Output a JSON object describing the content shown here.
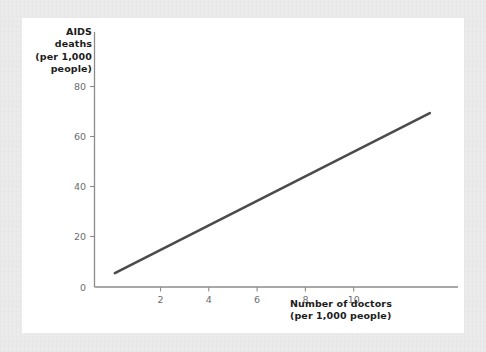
{
  "figure": {
    "card_background": "#ffffff",
    "mat_background": "#ebebec"
  },
  "chart_data": {
    "type": "line",
    "title": "",
    "subtitle": "",
    "ylabel_lines": [
      "AIDS",
      "deaths",
      "(per 1,000",
      "people)"
    ],
    "ylabel": "AIDS deaths (per 1,000 people)",
    "xlabel_lines": [
      "Number of doctors",
      "(per 1,000 people)"
    ],
    "xlabel": "Number of doctors (per 1,000 people)",
    "xlim": [
      0,
      11.6
    ],
    "ylim": [
      0,
      88
    ],
    "xticks": [
      2,
      4,
      6,
      8,
      10
    ],
    "yticks": [
      0,
      20,
      40,
      60,
      80
    ],
    "xtick_labels": [
      "2",
      "4",
      "6",
      "8",
      "10"
    ],
    "ytick_labels": [
      "0",
      "20",
      "40",
      "60",
      "80"
    ],
    "grid": false,
    "legend": false,
    "legend_position": "none",
    "series": [
      {
        "name": "AIDS deaths vs doctors",
        "color": "#4b4b4d",
        "line_width": 2.6,
        "x": [
          0.65,
          10.7
        ],
        "y": [
          4.8,
          60.0
        ],
        "points": [
          [
            0.65,
            4.8
          ],
          [
            10.7,
            60.0
          ]
        ]
      }
    ],
    "annotations": []
  },
  "axes": {
    "y_axis_color": "#8b8b8b",
    "x_axis_color": "#8b8b8b",
    "tick_label_color": "#6d6d6d",
    "axis_title_color": "#1c1c1c"
  }
}
